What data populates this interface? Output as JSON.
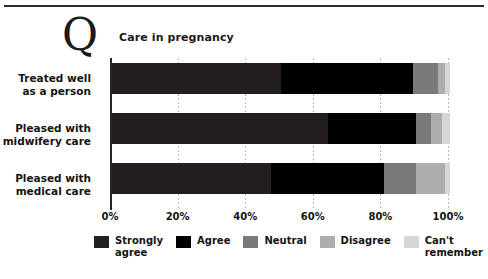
{
  "header": {
    "q_glyph": "Q",
    "title": "Care in pregnancy"
  },
  "chart_data": {
    "type": "bar",
    "subtype": "stacked-horizontal-100pct",
    "title": "Care in pregnancy",
    "xlabel": "",
    "ylabel": "",
    "xlim": [
      0,
      100
    ],
    "grid": true,
    "legend_position": "bottom",
    "categories": [
      "Treated well as a person",
      "Pleased with midwifery care",
      "Pleased with medical care"
    ],
    "category_lines": [
      [
        "Treated well",
        "as a person"
      ],
      [
        "Pleased with",
        "midwifery care"
      ],
      [
        "Pleased with",
        "medical care"
      ]
    ],
    "xticks": [
      0,
      20,
      40,
      60,
      80,
      100
    ],
    "xticklabels": [
      "0%",
      "20%",
      "40%",
      "60%",
      "80%",
      "100%"
    ],
    "series": [
      {
        "name": "Strongly agree",
        "color": "#231f1f",
        "values": [
          50,
          64,
          47
        ]
      },
      {
        "name": "Agree",
        "color": "#000000",
        "values": [
          39,
          26,
          33.5
        ]
      },
      {
        "name": "Neutral",
        "color": "#7a7a7a",
        "values": [
          7.5,
          4.5,
          9.5
        ]
      },
      {
        "name": "Disagree",
        "color": "#adadad",
        "values": [
          2,
          3,
          8.5
        ]
      },
      {
        "name": "Can't remember",
        "color": "#d6d6d6",
        "values": [
          1.5,
          2.5,
          1.5
        ]
      }
    ]
  },
  "legend": {
    "items": [
      {
        "label": "Strongly\nagree",
        "color": "#231f1f"
      },
      {
        "label": "Agree",
        "color": "#000000"
      },
      {
        "label": "Neutral",
        "color": "#7a7a7a"
      },
      {
        "label": "Disagree",
        "color": "#adadad"
      },
      {
        "label": "Can't\nremember",
        "color": "#d6d6d6"
      }
    ]
  }
}
